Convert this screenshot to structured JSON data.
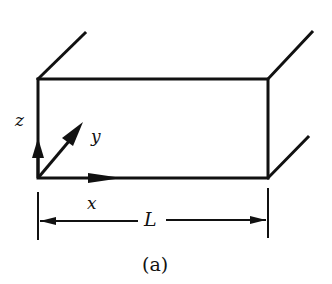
{
  "figure": {
    "caption": "(a)",
    "axes": {
      "x": "x",
      "y": "y",
      "z": "z"
    },
    "dimension_label": "L",
    "stroke_color": "#111111",
    "background": "#ffffff"
  }
}
